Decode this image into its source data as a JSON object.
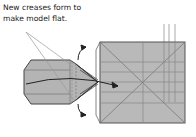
{
  "caption": {
    "line1": "New creases form to",
    "line2": "make model flat."
  },
  "colors": {
    "paper": "#b8b8b8",
    "line": "#555555",
    "crease": "#8a8a8a",
    "arrow": "#222222"
  },
  "diagram": {
    "elements": [
      "folded-flap-left",
      "square-base-right",
      "pointer-lines",
      "movement-arrows",
      "reference-lines-top"
    ]
  }
}
